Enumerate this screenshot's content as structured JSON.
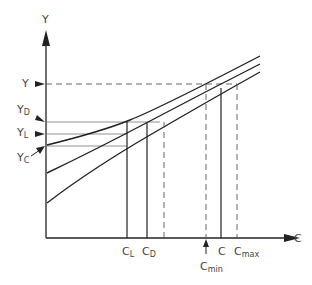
{
  "diagram": {
    "axes": {
      "y_label": "Y",
      "x_label": "C"
    },
    "y_markers": [
      {
        "main": "Y",
        "sub": "",
        "y": 84,
        "style": "dashed"
      },
      {
        "main": "Y",
        "sub": "D",
        "y": 122,
        "style": "thin"
      },
      {
        "main": "Y",
        "sub": "L",
        "y": 134,
        "style": "thin"
      },
      {
        "main": "Y",
        "sub": "C",
        "y": 145,
        "style": "thin"
      }
    ],
    "x_markers": [
      {
        "main": "C",
        "sub": "L",
        "x": 127,
        "style": "solid"
      },
      {
        "main": "C",
        "sub": "D",
        "x": 147,
        "style": "solid"
      },
      {
        "main": "",
        "sub": "",
        "x": 164,
        "style": "dashed"
      },
      {
        "main": "C",
        "sub": "min",
        "x": 206,
        "style": "dashed"
      },
      {
        "main": "C",
        "sub": "",
        "x": 221,
        "style": "solid"
      },
      {
        "main": "C",
        "sub": "max",
        "x": 237,
        "style": "dashed"
      }
    ],
    "curves": [
      {
        "name": "upper",
        "start": [
          47,
          145
        ],
        "end": [
          260,
          56
        ]
      },
      {
        "name": "middle",
        "start": [
          47,
          173
        ],
        "end": [
          260,
          64
        ]
      },
      {
        "name": "lower",
        "start": [
          47,
          203
        ],
        "end": [
          260,
          72
        ]
      }
    ],
    "colors": {
      "line": "#222222",
      "thin": "#666666",
      "text": "#444444"
    }
  }
}
